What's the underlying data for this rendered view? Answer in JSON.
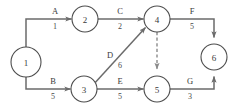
{
  "diagram": {
    "type": "activity-on-arrow-network",
    "nodes": [
      {
        "id": "n1",
        "label": "1",
        "cx": 26,
        "cy": 62,
        "r": 15
      },
      {
        "id": "n2",
        "label": "2",
        "cx": 85,
        "cy": 19,
        "r": 13
      },
      {
        "id": "n3",
        "label": "3",
        "cx": 84,
        "cy": 89,
        "r": 13
      },
      {
        "id": "n4",
        "label": "4",
        "cx": 157,
        "cy": 19,
        "r": 13
      },
      {
        "id": "n5",
        "label": "5",
        "cx": 157,
        "cy": 89,
        "r": 13
      },
      {
        "id": "n6",
        "label": "6",
        "cx": 214,
        "cy": 57,
        "r": 13
      }
    ],
    "edges": [
      {
        "id": "eA",
        "name": "A",
        "duration": "1",
        "from": "1",
        "to": "2",
        "style": "solid",
        "name_x": 55,
        "name_y": 14,
        "dur_x": 55,
        "dur_y": 29
      },
      {
        "id": "eB",
        "name": "B",
        "duration": "5",
        "from": "1",
        "to": "3",
        "style": "solid",
        "name_x": 53,
        "name_y": 84,
        "dur_x": 53,
        "dur_y": 99
      },
      {
        "id": "eC",
        "name": "C",
        "duration": "2",
        "from": "2",
        "to": "4",
        "style": "solid",
        "name_x": 120,
        "name_y": 14,
        "dur_x": 120,
        "dur_y": 29
      },
      {
        "id": "eD",
        "name": "D",
        "duration": "6",
        "from": "3",
        "to": "4",
        "style": "solid",
        "name_x": 110,
        "name_y": 58,
        "dur_x": 120,
        "dur_y": 68
      },
      {
        "id": "eE",
        "name": "E",
        "duration": "5",
        "from": "3",
        "to": "5",
        "style": "solid",
        "name_x": 120,
        "name_y": 84,
        "dur_x": 120,
        "dur_y": 99
      },
      {
        "id": "eF",
        "name": "F",
        "duration": "5",
        "from": "4",
        "to": "6",
        "style": "solid",
        "name_x": 192,
        "name_y": 14,
        "dur_x": 192,
        "dur_y": 29
      },
      {
        "id": "eG",
        "name": "G",
        "duration": "3",
        "from": "5",
        "to": "6",
        "style": "solid",
        "name_x": 190,
        "name_y": 84,
        "dur_x": 190,
        "dur_y": 99
      },
      {
        "id": "eDummy",
        "name": "",
        "duration": "",
        "from": "4",
        "to": "5",
        "style": "dashed"
      }
    ],
    "colors": {
      "background": "#ffffff",
      "node_stroke": "#4d4d4d",
      "edge_stroke": "#6b6b6b",
      "dashed_stroke": "#8a8a8a",
      "text": "#3a3a3a"
    }
  }
}
